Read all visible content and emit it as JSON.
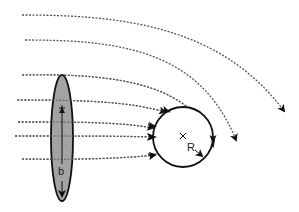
{
  "diagram": {
    "width": 299,
    "height": 212,
    "background": "#ffffff",
    "colors": {
      "stroke": "#111111",
      "streamline": "#555555",
      "ellipse_fill": "#a3a3a3"
    },
    "ellipse": {
      "cx": 62,
      "cy": 138,
      "rx": 11,
      "ry": 63,
      "label": "b",
      "label_pos": [
        58,
        175
      ],
      "center_mark": [
        62,
        108
      ],
      "dimension_arrow": {
        "from": [
          62,
          108
        ],
        "to": [
          62,
          199
        ]
      }
    },
    "circle": {
      "cx": 183,
      "cy": 137,
      "r": 30,
      "label": "R",
      "label_pos": [
        187,
        151
      ],
      "center_mark": [
        183,
        136
      ],
      "radius_arrow": {
        "from": [
          185,
          139
        ],
        "to": [
          204,
          158
        ]
      }
    },
    "streamlines": [
      {
        "id": "s1",
        "d": "M22,15 C120,15 220,25 284,111",
        "arrow": true
      },
      {
        "id": "s2",
        "d": "M25,40 C120,40 200,50 236,140",
        "arrow": true
      },
      {
        "id": "s3",
        "d": "M22,75 C120,73 195,85 213,146",
        "arrow": true
      },
      {
        "id": "s4",
        "d": "M17,100 C90,100 130,102 165,112",
        "arrow": true
      },
      {
        "id": "s5",
        "d": "M18,122 C80,122 120,122 153,128",
        "arrow": true
      },
      {
        "id": "s6",
        "d": "M15,136 C80,136 120,136 153,137",
        "arrow": true
      },
      {
        "id": "s7",
        "d": "M22,159 C80,160 130,158 155,155",
        "arrow": true
      }
    ],
    "circle_flow_arrows": [
      {
        "id": "c1",
        "at": [
          167,
          111
        ],
        "angle": 20
      },
      {
        "id": "c2",
        "at": [
          153,
          126
        ],
        "angle": 10
      },
      {
        "id": "c3",
        "at": [
          153,
          137
        ],
        "angle": 0
      },
      {
        "id": "c4",
        "at": [
          153,
          155
        ],
        "angle": -20
      },
      {
        "id": "c5",
        "at": [
          213,
          140
        ],
        "angle": 90
      }
    ]
  }
}
